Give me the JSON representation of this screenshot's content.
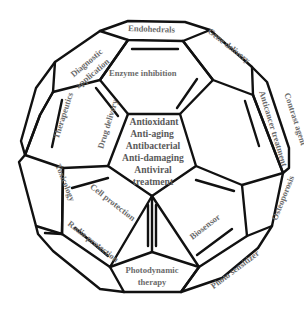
{
  "diagram": {
    "type": "fullerene-application-map",
    "center": {
      "lines": [
        "Antioxidant",
        "Anti-aging",
        "Antibacterial",
        "Anti-damaging",
        "Antiviral",
        "treatment"
      ]
    },
    "faces": {
      "endohedrals": "Endohedrals",
      "gene_delivery": "Gene delivery",
      "contrast_agent": "Contrast agent",
      "diagnostic_line1": "Diagnostic",
      "diagnostic_line2": "application",
      "enzyme_inhibition": "Enzyme inhibition",
      "therapeutics": "Therapeutics",
      "drug_delivery": "Drug delivery",
      "anticancer": "Anticancer treatment",
      "toxicology": "Toxicology",
      "osteoporosis": "Osteoporosis",
      "cell_protection": "Cell protection",
      "biosensor": "Biosensor",
      "radio_protection": "Radio protection",
      "photo_sensitizer": "Photo sensitizer",
      "photodynamic_line1": "Photodynamic",
      "photodynamic_line2": "therapy"
    },
    "colors": {
      "stroke": "#111111",
      "text": "#6b6b6b",
      "background": "#ffffff"
    }
  }
}
